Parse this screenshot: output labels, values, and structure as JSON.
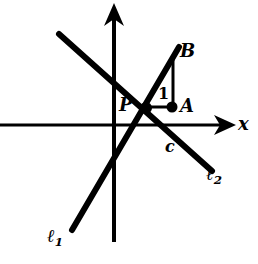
{
  "figure": {
    "background_color": "#ffffff",
    "ink_color": "#000000",
    "width": 258,
    "height": 264
  },
  "axes": {
    "x_axis": {
      "label": "x",
      "icon": "arrow-right-icon",
      "y_pixel": 125,
      "x_start_pixel": 0,
      "x_end_pixel": 234
    },
    "y_axis": {
      "label": "",
      "icon": "arrow-up-icon",
      "x_pixel": 114,
      "y_start_pixel": 240,
      "y_end_pixel": 4
    },
    "origin": {
      "x_pixel": 114,
      "y_pixel": 125
    }
  },
  "lines": [
    {
      "name": "l1",
      "label": "ℓ",
      "label_sub": "1",
      "description": "positively sloped line through P rising to the right",
      "from": {
        "x": 72,
        "y": 230
      },
      "to": {
        "x": 179,
        "y": 47
      },
      "stroke_width": 6
    },
    {
      "name": "l2",
      "label": "ℓ",
      "label_sub": "2",
      "description": "negatively sloped line through P falling to the right",
      "from": {
        "x": 59,
        "y": 34
      },
      "to": {
        "x": 212,
        "y": 171
      },
      "stroke_width": 6
    }
  ],
  "points": [
    {
      "name": "P",
      "label": "P",
      "x": 146,
      "y": 108,
      "dot": true,
      "note": "intersection of l1 and l2"
    },
    {
      "name": "A",
      "label": "A",
      "x": 172,
      "y": 107,
      "dot": true,
      "note": "foot of the run segment from P"
    },
    {
      "name": "B",
      "label": "B",
      "x": 174,
      "y": 55,
      "dot": false,
      "note": "point on l1 above A"
    },
    {
      "name": "C",
      "label": "c",
      "x": 172,
      "y": 130,
      "dot": false,
      "note": "point on l2 below A, near x-axis"
    }
  ],
  "segments": [
    {
      "name": "run-segment-PA",
      "label": "1",
      "from": {
        "x": 146,
        "y": 107
      },
      "to": {
        "x": 172,
        "y": 107
      },
      "stroke_width": 3
    },
    {
      "name": "rise-segment-AB",
      "label": "",
      "from": {
        "x": 173,
        "y": 107
      },
      "to": {
        "x": 173,
        "y": 55
      },
      "stroke_width": 3
    }
  ],
  "labels": {
    "axis_x": "x",
    "point_p": "P",
    "point_a": "A",
    "point_b": "B",
    "point_c": "c",
    "unit_run": "1",
    "line_l1_base": "ℓ",
    "line_l1_sub": "1",
    "line_l2_base": "ℓ",
    "line_l2_sub": "2"
  }
}
